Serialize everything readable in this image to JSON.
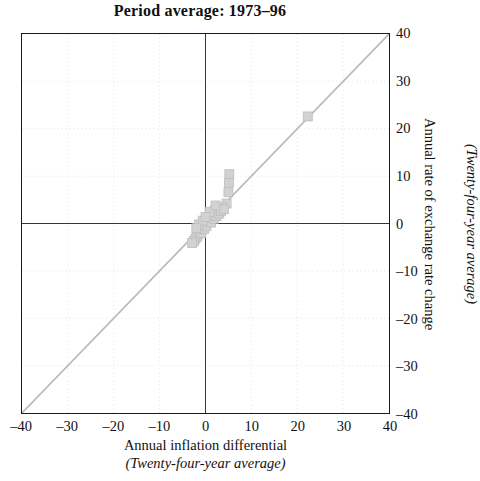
{
  "chart_data": {
    "type": "scatter",
    "title": "Period average: 1973–96",
    "xlabel": "Annual inflation differential",
    "xlabel_sub": "(Twenty-four-year average)",
    "ylabel": "Annual rate of exchange rate change",
    "ylabel_sub": "(Twenty-four-year average)",
    "xlim": [
      -40,
      40
    ],
    "ylim": [
      -40,
      40
    ],
    "xticks": [
      -40,
      -30,
      -20,
      -10,
      0,
      10,
      20,
      30,
      40
    ],
    "yticks": [
      -40,
      -30,
      -20,
      -10,
      0,
      10,
      20,
      30,
      40
    ],
    "xticklabels": [
      "–40",
      "–30",
      "–20",
      "–10",
      "0",
      "10",
      "20",
      "30",
      "40"
    ],
    "yticklabels": [
      "–40",
      "–30",
      "–20",
      "–10",
      "0",
      "10",
      "20",
      "30",
      "40"
    ],
    "grid": true,
    "grid_style": "dotted",
    "y_axis_position": "right",
    "legend": null,
    "reference_line": {
      "name": "forty-five-degree-line",
      "type": "identity",
      "from": [
        -40,
        -40
      ],
      "to": [
        40,
        40
      ],
      "color": "#b8b8b8"
    },
    "marker": {
      "shape": "square",
      "fill": "#d2d2d2",
      "edge": "#bcbcbc",
      "size_px": 9
    },
    "points": [
      {
        "x": 22.3,
        "y": 22.6
      },
      {
        "x": 5.2,
        "y": 10.4
      },
      {
        "x": 5.1,
        "y": 8.6
      },
      {
        "x": 5.0,
        "y": 6.6
      },
      {
        "x": 4.6,
        "y": 4.2
      },
      {
        "x": 3.6,
        "y": 3.4
      },
      {
        "x": 2.6,
        "y": 3.1
      },
      {
        "x": 2.0,
        "y": 2.8
      },
      {
        "x": 1.5,
        "y": 2.2
      },
      {
        "x": 1.0,
        "y": 1.7
      },
      {
        "x": 0.7,
        "y": 1.2
      },
      {
        "x": 0.4,
        "y": 0.8
      },
      {
        "x": 0.1,
        "y": 0.4
      },
      {
        "x": -0.2,
        "y": 0.0
      },
      {
        "x": -0.5,
        "y": -0.4
      },
      {
        "x": -0.8,
        "y": -0.9
      },
      {
        "x": -1.0,
        "y": -1.4
      },
      {
        "x": -1.3,
        "y": -1.9
      },
      {
        "x": -1.6,
        "y": -2.3
      },
      {
        "x": -1.9,
        "y": -2.8
      },
      {
        "x": -2.2,
        "y": -3.2
      },
      {
        "x": -2.5,
        "y": -3.7
      },
      {
        "x": -2.9,
        "y": -4.1
      },
      {
        "x": -0.9,
        "y": -2.0
      },
      {
        "x": -0.3,
        "y": -1.2
      },
      {
        "x": 0.2,
        "y": -0.6
      },
      {
        "x": 1.2,
        "y": 0.2
      },
      {
        "x": 1.8,
        "y": 1.0
      },
      {
        "x": 2.4,
        "y": 1.6
      },
      {
        "x": 3.0,
        "y": 2.1
      },
      {
        "x": 3.4,
        "y": 2.6
      },
      {
        "x": 4.0,
        "y": 3.0
      },
      {
        "x": -1.4,
        "y": -0.2
      },
      {
        "x": -0.6,
        "y": 0.6
      },
      {
        "x": 0.9,
        "y": 2.4
      },
      {
        "x": -2.0,
        "y": -1.0
      },
      {
        "x": 0.0,
        "y": 1.4
      },
      {
        "x": 2.2,
        "y": 3.8
      }
    ]
  }
}
